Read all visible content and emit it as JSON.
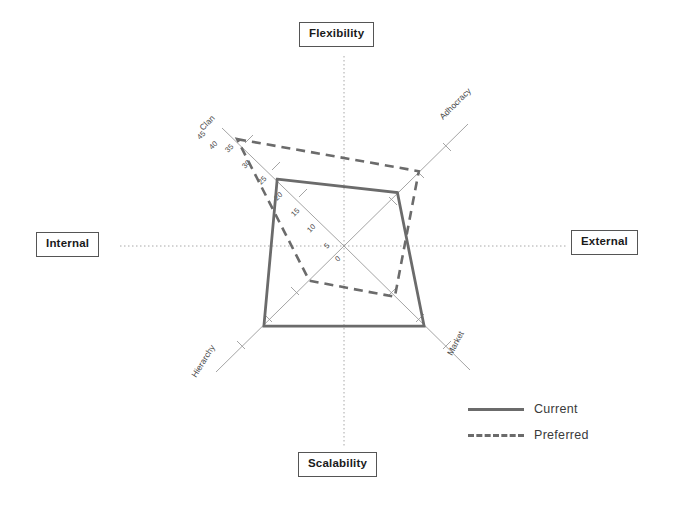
{
  "chart_data": {
    "type": "radar",
    "title": "",
    "categories": [
      "Clan",
      "Adhocracy",
      "Market",
      "Hierarchy"
    ],
    "series": [
      {
        "name": "Current",
        "values": [
          25,
          20,
          30,
          30
        ],
        "style": "solid"
      },
      {
        "name": "Preferred",
        "values": [
          40,
          28,
          19,
          13
        ],
        "style": "dashed"
      }
    ],
    "tick_labels": [
      "0",
      "5",
      "10",
      "15",
      "20",
      "25",
      "30",
      "35",
      "40",
      "45"
    ],
    "radial_min": 0,
    "radial_max": 45,
    "radial_step": 5,
    "grid": false,
    "legend_position": "bottom-right",
    "axis_angles_deg": [
      135,
      45,
      315,
      225
    ],
    "quadrant_labels": {
      "top": "Flexibility",
      "left": "Internal",
      "right": "External",
      "bottom": "Scalability"
    }
  },
  "axes": {
    "clan": "Clan",
    "adhocracy": "Adhocracy",
    "market": "Market",
    "hierarchy": "Hierarchy"
  },
  "frame_labels": {
    "flexibility": "Flexibility",
    "internal": "Internal",
    "external": "External",
    "scalability": "Scalability"
  },
  "legend": {
    "current": "Current",
    "preferred": "Preferred"
  },
  "ticks": {
    "t0": "0",
    "t5": "5",
    "t10": "10",
    "t15": "15",
    "t20": "20",
    "t25": "25",
    "t30": "30",
    "t35": "35",
    "t40": "40",
    "t45": "45"
  },
  "colors": {
    "current_line": "#6b6b6b",
    "preferred_line": "#6b6b6b",
    "axis_line": "#9a9a9a",
    "crosshair": "#a8a8a8",
    "box_border": "#555555",
    "text": "#3a3a3a"
  }
}
